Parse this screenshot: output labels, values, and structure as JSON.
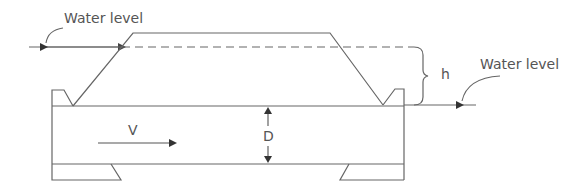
{
  "diagram": {
    "type": "culvert-cross-section",
    "labels": {
      "water_level_upstream": "Water level",
      "water_level_downstream": "Water level",
      "head_difference": "h",
      "velocity": "V",
      "depth": "D"
    },
    "colors": {
      "line": "#555555",
      "text": "#555555",
      "background": "#ffffff"
    }
  }
}
